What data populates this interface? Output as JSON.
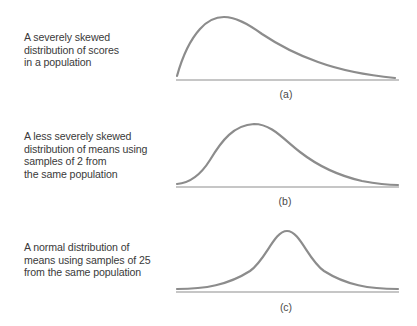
{
  "figure": {
    "panels": [
      {
        "id": "a",
        "label": "(a)",
        "description_lines": [
          "A severely skewed",
          "distribution of scores",
          "in a population"
        ],
        "shape": "severely positively skewed"
      },
      {
        "id": "b",
        "label": "(b)",
        "description_lines": [
          "A less severely skewed",
          "distribution of means using",
          "samples of 2 from",
          "the same population"
        ],
        "shape": "moderately positively skewed"
      },
      {
        "id": "c",
        "label": "(c)",
        "description_lines": [
          "A normal distribution of",
          "means using samples of 25",
          "from the same population"
        ],
        "shape": "normal (symmetric)"
      }
    ],
    "colors": {
      "curve": "#8c8c8c",
      "baseline": "#c6c6c6",
      "text": "#3a3a3a"
    }
  }
}
